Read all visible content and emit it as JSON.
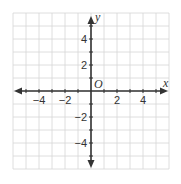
{
  "diagram": {
    "type": "coordinate-plane",
    "colors": {
      "grid": "#d6d6d6",
      "axis": "#333333",
      "text": "#333333",
      "background": "#ffffff"
    },
    "origin_px": [
      91,
      91
    ],
    "unit_px": 13,
    "grid_range": {
      "x": [
        -6,
        6
      ],
      "y": [
        -6,
        6
      ]
    },
    "axes": {
      "x_label": "x",
      "y_label": "y",
      "origin_label": "O"
    },
    "x_ticks": [
      {
        "value": -4,
        "label": "−4"
      },
      {
        "value": -2,
        "label": "−2"
      },
      {
        "value": 2,
        "label": "2"
      },
      {
        "value": 4,
        "label": "4"
      }
    ],
    "y_ticks": [
      {
        "value": 4,
        "label": "4"
      },
      {
        "value": 2,
        "label": "2"
      },
      {
        "value": -2,
        "label": "−2"
      },
      {
        "value": -4,
        "label": "−4"
      }
    ]
  }
}
